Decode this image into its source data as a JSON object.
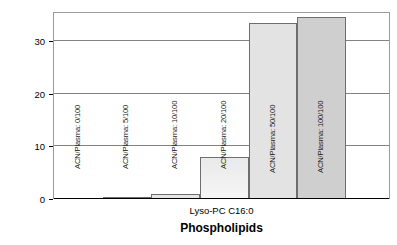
{
  "chart_data": {
    "type": "bar",
    "title": "",
    "xlabel": "Phospholipids",
    "ylabel": "Increase of response",
    "category_label": "Lyso-PC C16:0",
    "categories": [
      "ACN/Plasma: 0/100",
      "ACN/Plasma: 5/100",
      "ACN/Plasma: 10/100",
      "ACN/Plasma: 20/100",
      "ACN/Plasma: 50/100",
      "ACN/Plasma: 100/100"
    ],
    "values": [
      0,
      0.15,
      0.9,
      7.9,
      33.4,
      34.6
    ],
    "ylim": [
      0,
      35.5
    ],
    "yticks": [
      0,
      10,
      20,
      30
    ],
    "ytick_labels": [
      "0",
      "10",
      "20",
      "30"
    ],
    "grid": "horizontal",
    "legend": "none",
    "bar_colors": [
      "#f2f2f2",
      "#ededed",
      "#e6e6e6",
      "#e0e0e0",
      "#e3e3e3",
      "#cfcfcf"
    ],
    "bar_border_color": "#6e6e6e",
    "axis_color": "#000000",
    "grid_color": "#828282"
  }
}
